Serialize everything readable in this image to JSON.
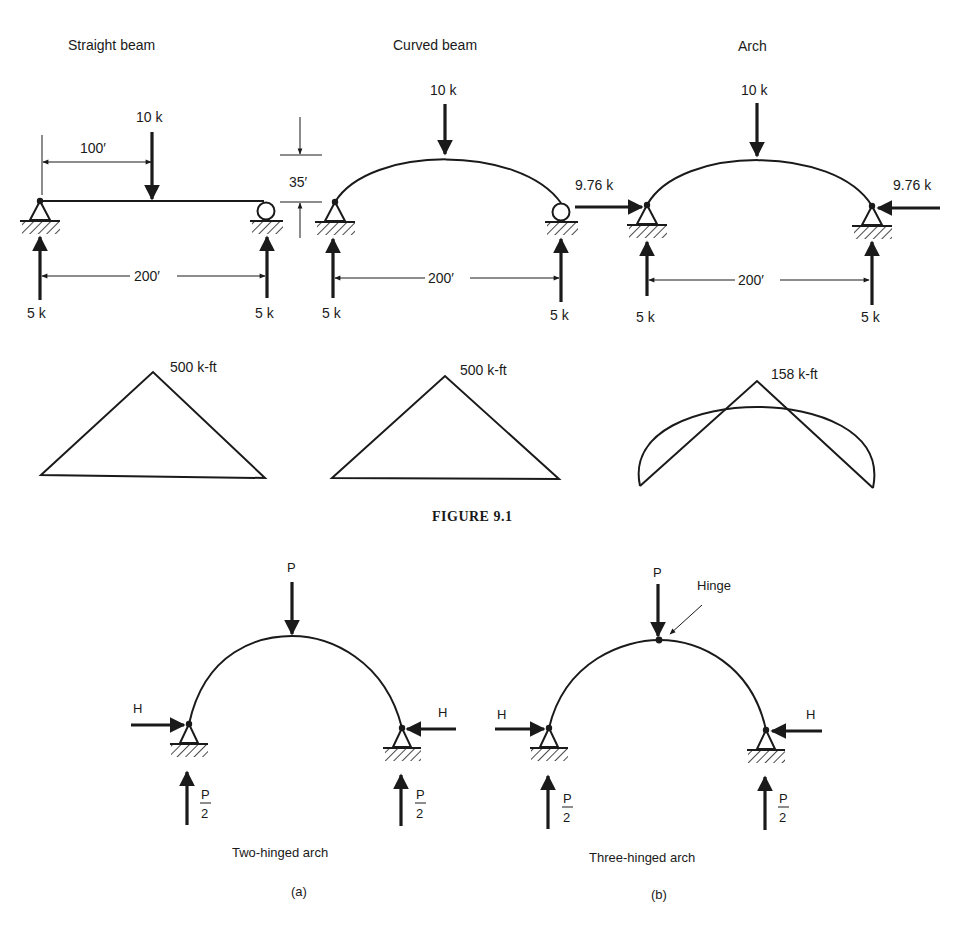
{
  "figure_9_1": {
    "caption": "FIGURE 9.1",
    "straight_beam": {
      "title": "Straight beam",
      "load_label": "10 k",
      "dim_load_position": "100′",
      "dim_span": "200′",
      "reaction_left": "5 k",
      "reaction_right": "5 k",
      "moment_label": "500 k-ft"
    },
    "rise_dimension": "35′",
    "curved_beam": {
      "title": "Curved beam",
      "load_label": "10 k",
      "dim_span": "200′",
      "reaction_left": "5 k",
      "reaction_right": "5 k",
      "moment_label": "500 k-ft"
    },
    "arch": {
      "title": "Arch",
      "load_label": "10 k",
      "thrust_left": "9.76 k",
      "thrust_right": "9.76 k",
      "dim_span": "200′",
      "reaction_left": "5 k",
      "reaction_right": "5 k",
      "moment_label": "158 k-ft"
    }
  },
  "figure_9_2": {
    "two_hinged": {
      "load_label": "P",
      "thrust_left": "H",
      "thrust_right": "H",
      "reaction_numerator": "P",
      "reaction_denominator": "2",
      "title": "Two-hinged arch",
      "sublabel": "(a)"
    },
    "three_hinged": {
      "load_label": "P",
      "hinge_label": "Hinge",
      "thrust_left": "H",
      "thrust_right": "H",
      "reaction_numerator": "P",
      "reaction_denominator": "2",
      "title": "Three-hinged arch",
      "sublabel": "(b)"
    }
  }
}
